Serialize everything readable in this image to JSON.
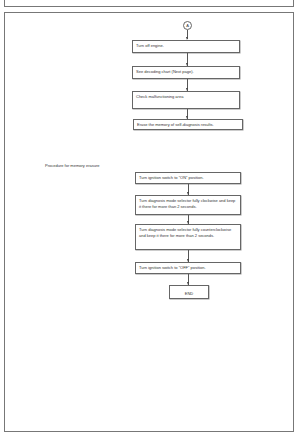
{
  "connector": {
    "label": "A"
  },
  "flow1": {
    "steps": [
      "Turn off engine.",
      "See decoding chart (Next page).",
      "Check malfunctioning area",
      "Erase the memory of self-diagnosis results."
    ]
  },
  "flow2": {
    "title": "Procedure for memory erasure",
    "steps": [
      "Turn ignition switch to \"ON\" position.",
      "Turn diagnosis mode selector fully clockwise and keep it there for more than 2 seconds.",
      "Turn diagnosis mode selector fully counterclockwise and keep it there for more than 2 seconds.",
      "Turn ignition switch to \"OFF\" position.",
      "END"
    ]
  }
}
